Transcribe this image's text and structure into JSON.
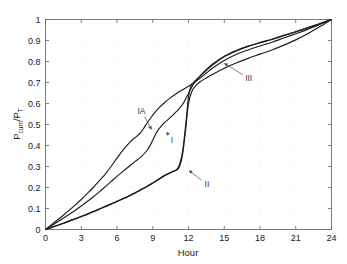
{
  "chart_data": {
    "type": "line",
    "title": "",
    "xlabel": "Hour",
    "ylabel": "P_cum/P_T",
    "ylabel_parts": {
      "base1": "P",
      "sub1": "cum",
      "slash": "/",
      "base2": "P",
      "sub2": "T"
    },
    "xlim": [
      0,
      24
    ],
    "ylim": [
      0,
      1
    ],
    "xticks": [
      0,
      3,
      6,
      9,
      12,
      15,
      18,
      21,
      24
    ],
    "xtick_labels": [
      "0",
      "3",
      "6",
      "9",
      "12",
      "15",
      "18",
      "21",
      "24"
    ],
    "yticks": [
      0,
      0.1,
      0.2,
      0.3,
      0.4,
      0.5,
      0.6,
      0.7,
      0.8,
      0.9,
      1
    ],
    "ytick_labels": [
      "0",
      "0.1",
      "0.2",
      "0.3",
      "0.4",
      "0.5",
      "0.6",
      "0.7",
      "0.8",
      "0.9",
      "1"
    ],
    "grid": true,
    "grid_style": "dotted",
    "legend": "none",
    "line_color": "#1c1c1c",
    "background_color": "#ffffff",
    "annotations": [
      {
        "text": "IA",
        "label_x": 8.05,
        "label_y": 0.565,
        "point_x": 8.95,
        "point_y": 0.47
      },
      {
        "text": "I",
        "label_x": 10.6,
        "label_y": 0.425,
        "point_x": 10.1,
        "point_y": 0.47
      },
      {
        "text": "II",
        "label_x": 13.55,
        "label_y": 0.215,
        "point_x": 11.95,
        "point_y": 0.285
      },
      {
        "text": "III",
        "label_x": 17.05,
        "label_y": 0.72,
        "point_x": 14.9,
        "point_y": 0.795
      }
    ],
    "series": [
      {
        "name": "IA",
        "x": [
          0,
          0.5,
          1,
          1.5,
          2,
          2.5,
          3,
          3.5,
          4,
          4.5,
          5,
          5.5,
          6,
          6.5,
          7,
          7.25,
          7.5,
          7.75,
          8,
          8.25,
          8.5,
          8.75,
          9,
          9.5,
          10,
          10.5,
          11,
          11.5,
          12,
          12.5,
          13,
          13.5,
          14,
          15,
          16,
          17,
          18,
          19,
          20,
          21,
          22,
          23,
          24
        ],
        "y": [
          0,
          0.023,
          0.045,
          0.068,
          0.092,
          0.117,
          0.143,
          0.171,
          0.2,
          0.231,
          0.263,
          0.3,
          0.34,
          0.378,
          0.41,
          0.425,
          0.437,
          0.448,
          0.463,
          0.483,
          0.505,
          0.525,
          0.545,
          0.578,
          0.605,
          0.628,
          0.648,
          0.665,
          0.682,
          0.7,
          0.722,
          0.745,
          0.768,
          0.805,
          0.833,
          0.855,
          0.874,
          0.892,
          0.912,
          0.932,
          0.953,
          0.976,
          1.0
        ]
      },
      {
        "name": "I",
        "x": [
          0,
          0.5,
          1,
          1.5,
          2,
          2.5,
          3,
          3.5,
          4,
          4.5,
          5,
          5.5,
          6,
          6.5,
          7,
          7.5,
          8,
          8.5,
          8.75,
          9,
          9.25,
          9.5,
          9.75,
          10,
          10.25,
          10.5,
          11,
          11.5,
          12,
          12.5,
          13,
          13.5,
          14,
          15,
          16,
          17,
          18,
          19,
          20,
          21,
          22,
          23,
          24
        ],
        "y": [
          0,
          0.018,
          0.036,
          0.054,
          0.073,
          0.092,
          0.112,
          0.133,
          0.155,
          0.178,
          0.203,
          0.228,
          0.253,
          0.277,
          0.3,
          0.323,
          0.345,
          0.375,
          0.397,
          0.425,
          0.455,
          0.478,
          0.495,
          0.51,
          0.522,
          0.535,
          0.562,
          0.595,
          0.648,
          0.7,
          0.733,
          0.762,
          0.787,
          0.825,
          0.852,
          0.873,
          0.89,
          0.906,
          0.925,
          0.942,
          0.961,
          0.98,
          1.0
        ]
      },
      {
        "name": "II",
        "x": [
          0,
          0.5,
          1,
          1.5,
          2,
          2.5,
          3,
          3.5,
          4,
          4.5,
          5,
          5.5,
          6,
          6.5,
          7,
          7.5,
          8,
          8.5,
          9,
          9.5,
          10,
          10.5,
          10.75,
          11,
          11.25,
          11.5,
          11.75,
          12,
          12.2,
          12.5,
          13,
          13.5,
          14,
          15,
          16,
          17,
          18,
          19,
          20,
          21,
          22,
          23,
          24
        ],
        "y": [
          0,
          0.01,
          0.02,
          0.03,
          0.041,
          0.052,
          0.063,
          0.074,
          0.086,
          0.098,
          0.11,
          0.122,
          0.134,
          0.147,
          0.16,
          0.175,
          0.19,
          0.205,
          0.222,
          0.24,
          0.258,
          0.272,
          0.278,
          0.285,
          0.31,
          0.37,
          0.49,
          0.63,
          0.682,
          0.705,
          0.732,
          0.758,
          0.782,
          0.822,
          0.85,
          0.872,
          0.889,
          0.905,
          0.923,
          0.941,
          0.96,
          0.979,
          1.0
        ]
      },
      {
        "name": "III",
        "x": [
          0,
          0.5,
          1,
          1.5,
          2,
          2.5,
          3,
          3.5,
          4,
          4.5,
          5,
          5.5,
          6,
          6.5,
          7,
          7.5,
          8,
          8.5,
          9,
          9.5,
          10,
          10.5,
          11,
          11.25,
          11.5,
          11.75,
          12,
          12.3,
          12.7,
          13,
          13.5,
          14,
          15,
          16,
          17,
          18,
          19,
          20,
          21,
          22,
          23,
          24
        ],
        "y": [
          0,
          0.009,
          0.019,
          0.029,
          0.04,
          0.05,
          0.061,
          0.072,
          0.084,
          0.096,
          0.108,
          0.12,
          0.133,
          0.146,
          0.159,
          0.173,
          0.188,
          0.203,
          0.22,
          0.238,
          0.256,
          0.27,
          0.283,
          0.3,
          0.355,
          0.47,
          0.6,
          0.66,
          0.69,
          0.705,
          0.722,
          0.738,
          0.768,
          0.793,
          0.815,
          0.835,
          0.855,
          0.878,
          0.903,
          0.932,
          0.965,
          1.0
        ]
      }
    ]
  }
}
